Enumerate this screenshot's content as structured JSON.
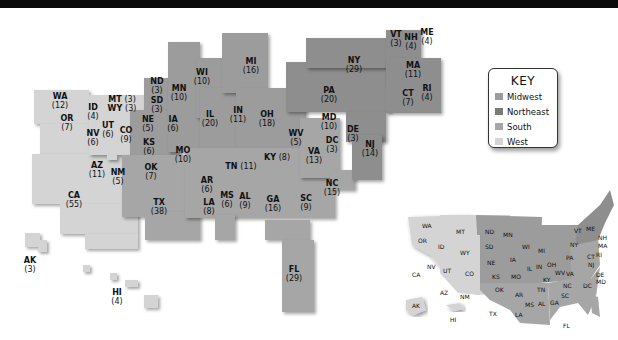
{
  "header": {
    "bar_color": "#0a0a0a"
  },
  "key": {
    "title": "KEY",
    "items": [
      {
        "label": "Midwest",
        "color": "#9c9c9c"
      },
      {
        "label": "Northeast",
        "color": "#8e8e8e"
      },
      {
        "label": "South",
        "color": "#a6a6a6"
      },
      {
        "label": "West",
        "color": "#d4d4d4"
      }
    ]
  },
  "states": {
    "WA": {
      "abbr": "WA",
      "votes": "(12)"
    },
    "OR": {
      "abbr": "OR",
      "votes": "(7)"
    },
    "CA": {
      "abbr": "CA",
      "votes": "(55)"
    },
    "ID": {
      "abbr": "ID",
      "votes": "(4)"
    },
    "NV": {
      "abbr": "NV",
      "votes": "(6)"
    },
    "UT": {
      "abbr": "UT",
      "votes": "(6)"
    },
    "AZ": {
      "abbr": "AZ",
      "votes": "(11)"
    },
    "MT": {
      "abbr": "MT",
      "votes": "(3)"
    },
    "WY": {
      "abbr": "WY",
      "votes": "(3)"
    },
    "CO": {
      "abbr": "CO",
      "votes": "(9)"
    },
    "NM": {
      "abbr": "NM",
      "votes": "(5)"
    },
    "AK": {
      "abbr": "AK",
      "votes": "(3)"
    },
    "HI": {
      "abbr": "HI",
      "votes": "(4)"
    },
    "ND": {
      "abbr": "ND",
      "votes": "(3)"
    },
    "SD": {
      "abbr": "SD",
      "votes": "(3)"
    },
    "NE": {
      "abbr": "NE",
      "votes": "(5)"
    },
    "KS": {
      "abbr": "KS",
      "votes": "(6)"
    },
    "MN": {
      "abbr": "MN",
      "votes": "(10)"
    },
    "IA": {
      "abbr": "IA",
      "votes": "(6)"
    },
    "MO": {
      "abbr": "MO",
      "votes": "(10)"
    },
    "WI": {
      "abbr": "WI",
      "votes": "(10)"
    },
    "IL": {
      "abbr": "IL",
      "votes": "(20)"
    },
    "MI": {
      "abbr": "MI",
      "votes": "(16)"
    },
    "IN": {
      "abbr": "IN",
      "votes": "(11)"
    },
    "OH": {
      "abbr": "OH",
      "votes": "(18)"
    },
    "OK": {
      "abbr": "OK",
      "votes": "(7)"
    },
    "TX": {
      "abbr": "TX",
      "votes": "(38)"
    },
    "AR": {
      "abbr": "AR",
      "votes": "(6)"
    },
    "LA": {
      "abbr": "LA",
      "votes": "(8)"
    },
    "MS": {
      "abbr": "MS",
      "votes": "(6)"
    },
    "AL": {
      "abbr": "AL",
      "votes": "(9)"
    },
    "TN": {
      "abbr": "TN",
      "votes": "(11)"
    },
    "KY": {
      "abbr": "KY",
      "votes": "(8)"
    },
    "GA": {
      "abbr": "GA",
      "votes": "(16)"
    },
    "FL": {
      "abbr": "FL",
      "votes": "(29)"
    },
    "SC": {
      "abbr": "SC",
      "votes": "(9)"
    },
    "NC": {
      "abbr": "NC",
      "votes": "(15)"
    },
    "VA": {
      "abbr": "VA",
      "votes": "(13)"
    },
    "WV": {
      "abbr": "WV",
      "votes": "(5)"
    },
    "MD": {
      "abbr": "MD",
      "votes": "(10)"
    },
    "DC": {
      "abbr": "DC",
      "votes": "(3)"
    },
    "DE": {
      "abbr": "DE",
      "votes": "(3)"
    },
    "PA": {
      "abbr": "PA",
      "votes": "(20)"
    },
    "NJ": {
      "abbr": "NJ",
      "votes": "(14)"
    },
    "NY": {
      "abbr": "NY",
      "votes": "(29)"
    },
    "CT": {
      "abbr": "CT",
      "votes": "(7)"
    },
    "RI": {
      "abbr": "RI",
      "votes": "(4)"
    },
    "MA": {
      "abbr": "MA",
      "votes": "(11)"
    },
    "VT": {
      "abbr": "VT",
      "votes": "(3)"
    },
    "NH": {
      "abbr": "NH",
      "votes": "(4)"
    },
    "ME": {
      "abbr": "ME",
      "votes": "(4)"
    }
  },
  "inset_labels": [
    "WA",
    "OR",
    "CA",
    "ID",
    "NV",
    "MT",
    "WY",
    "UT",
    "CO",
    "AZ",
    "NM",
    "ND",
    "SD",
    "NE",
    "KS",
    "OK",
    "TX",
    "MN",
    "IA",
    "MO",
    "AR",
    "LA",
    "WI",
    "IL",
    "MI",
    "IN",
    "OH",
    "KY",
    "TN",
    "MS",
    "AL",
    "GA",
    "FL",
    "SC",
    "NC",
    "VA",
    "WV",
    "PA",
    "NY",
    "VT",
    "ME",
    "NH",
    "MA",
    "RI",
    "CT",
    "NJ",
    "DE",
    "MD",
    "DC",
    "AK",
    "HI"
  ]
}
